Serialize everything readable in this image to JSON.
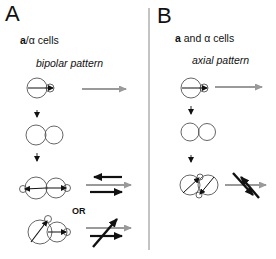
{
  "panels": [
    {
      "letter": "A",
      "cell_type_bold": "a",
      "cell_type_rest": "/α cells",
      "pattern": "bipolar pattern",
      "or_label": "OR"
    },
    {
      "letter": "B",
      "cell_type_bold": "a",
      "cell_type_rest": " and α cells",
      "pattern": "axial pattern"
    }
  ],
  "colors": {
    "black_arrow": "#111111",
    "gray_arrow": "#9a9a9a",
    "cell_outline": "#555555",
    "divider": "#888888"
  }
}
